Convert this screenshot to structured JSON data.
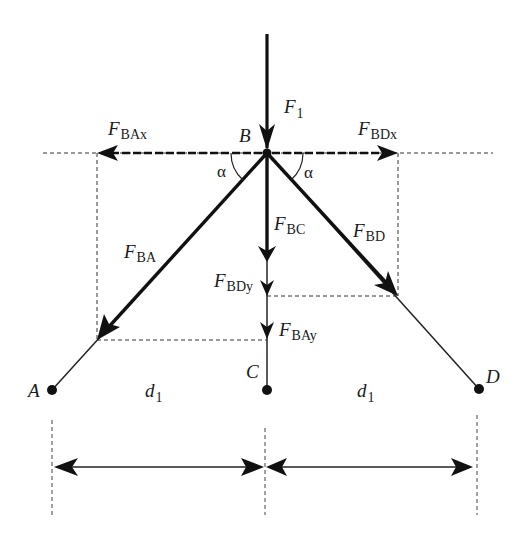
{
  "diagram": {
    "type": "free-body force diagram",
    "colors": {
      "stroke": "#111111",
      "background": "#ffffff"
    },
    "points": {
      "A": {
        "label": "A",
        "x": 52,
        "y": 390
      },
      "B": {
        "label": "B",
        "x": 267,
        "y": 153
      },
      "C": {
        "label": "C",
        "x": 267,
        "y": 390
      },
      "D": {
        "label": "D",
        "x": 479,
        "y": 389
      }
    },
    "forces": {
      "F1": {
        "main": "F",
        "sub": "1"
      },
      "FBAx": {
        "main": "F",
        "sub": "BAx"
      },
      "FBDx": {
        "main": "F",
        "sub": "BDx"
      },
      "FBA": {
        "main": "F",
        "sub": "BA"
      },
      "FBC": {
        "main": "F",
        "sub": "BC"
      },
      "FBD": {
        "main": "F",
        "sub": "BD"
      },
      "FBDy": {
        "main": "F",
        "sub": "BDy"
      },
      "FBAy": {
        "main": "F",
        "sub": "BAy"
      }
    },
    "angles": {
      "left": "α",
      "right": "α"
    },
    "dimensions": {
      "left": {
        "main": "d",
        "sub": "1"
      },
      "right": {
        "main": "d",
        "sub": "1"
      }
    }
  }
}
